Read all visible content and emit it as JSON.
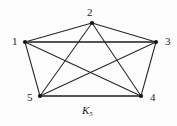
{
  "figure": {
    "name": "complete-graph-k5",
    "caption": "K",
    "caption_subscript": "5",
    "background_color": "#fdfdfd",
    "edge_color": "#262626",
    "thick_edge_color": "#545454",
    "vertex_color": "#141414",
    "label_color": "#1c1c1c"
  },
  "chart_data": {
    "type": "diagram",
    "title": "K5",
    "graph": "complete",
    "vertex_count": 5,
    "edge_count": 10,
    "vertices": [
      {
        "id": "1",
        "label": "1",
        "x": 25,
        "y": 42,
        "label_x": 12,
        "label_y": 36
      },
      {
        "id": "2",
        "label": "2",
        "x": 92,
        "y": 23,
        "label_x": 87,
        "label_y": 7
      },
      {
        "id": "3",
        "label": "3",
        "x": 156,
        "y": 42,
        "label_x": 165,
        "label_y": 36
      },
      {
        "id": "4",
        "label": "4",
        "x": 141,
        "y": 96,
        "label_x": 150,
        "label_y": 92
      },
      {
        "id": "5",
        "label": "5",
        "x": 40,
        "y": 96,
        "label_x": 27,
        "label_y": 92
      }
    ],
    "edges": [
      {
        "from": "1",
        "to": "2",
        "style": "thin"
      },
      {
        "from": "1",
        "to": "3",
        "style": "thick"
      },
      {
        "from": "1",
        "to": "4",
        "style": "thin"
      },
      {
        "from": "1",
        "to": "5",
        "style": "thin"
      },
      {
        "from": "2",
        "to": "3",
        "style": "thin"
      },
      {
        "from": "2",
        "to": "4",
        "style": "thin"
      },
      {
        "from": "2",
        "to": "5",
        "style": "thin"
      },
      {
        "from": "3",
        "to": "4",
        "style": "thin"
      },
      {
        "from": "3",
        "to": "5",
        "style": "thin"
      },
      {
        "from": "4",
        "to": "5",
        "style": "thick"
      }
    ]
  }
}
